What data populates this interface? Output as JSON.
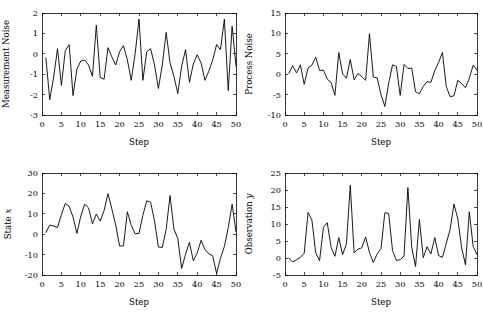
{
  "figure": {
    "background": "#ffffff",
    "line_color": "#000000",
    "width": 483,
    "height": 322,
    "panel_count": 4
  },
  "chart_data": [
    {
      "type": "line",
      "id": "measurement-noise",
      "position": "top-left",
      "title": "",
      "xlabel": "Step",
      "ylabel": "Measurement Noise",
      "ylabel_italic_suffix": "",
      "xlim": [
        0,
        50
      ],
      "ylim": [
        -3,
        2
      ],
      "xticks": [
        0,
        5,
        10,
        15,
        20,
        25,
        30,
        35,
        40,
        45,
        50
      ],
      "yticks": [
        -3,
        -2,
        -1,
        0,
        1,
        2
      ],
      "grid": false,
      "legend": "none",
      "x": [
        1,
        2,
        3,
        4,
        5,
        6,
        7,
        8,
        9,
        10,
        11,
        12,
        13,
        14,
        15,
        16,
        17,
        18,
        19,
        20,
        21,
        22,
        23,
        24,
        25,
        26,
        27,
        28,
        29,
        30,
        31,
        32,
        33,
        34,
        35,
        36,
        37,
        38,
        39,
        40,
        41,
        42,
        43,
        44,
        45,
        46,
        47,
        48,
        49,
        50
      ],
      "values": [
        -0.2,
        -2.25,
        -1.15,
        0.25,
        -1.55,
        0.15,
        0.45,
        -2.05,
        -0.75,
        -0.35,
        -0.3,
        -0.55,
        -1.1,
        1.4,
        -1.15,
        -1.25,
        0.3,
        -0.15,
        -0.55,
        0.1,
        0.4,
        -0.3,
        -1.3,
        0.0,
        1.7,
        -1.3,
        0.1,
        0.25,
        -0.55,
        -1.7,
        -0.55,
        1.05,
        -0.45,
        -1.1,
        -1.95,
        -0.6,
        0.2,
        -1.4,
        -0.5,
        -0.05,
        -0.45,
        -1.3,
        -0.85,
        -0.3,
        0.45,
        0.2,
        1.7,
        -1.8,
        1.35,
        -0.6
      ]
    },
    {
      "type": "line",
      "id": "process-noise",
      "position": "top-right",
      "title": "",
      "xlabel": "Step",
      "ylabel": "Process Noise",
      "ylabel_italic_suffix": "",
      "xlim": [
        0,
        50
      ],
      "ylim": [
        -10,
        15
      ],
      "xticks": [
        0,
        5,
        10,
        15,
        20,
        25,
        30,
        35,
        40,
        45,
        50
      ],
      "yticks": [
        -10,
        -5,
        0,
        5,
        10,
        15
      ],
      "grid": false,
      "legend": "none",
      "x": [
        1,
        2,
        3,
        4,
        5,
        6,
        7,
        8,
        9,
        10,
        11,
        12,
        13,
        14,
        15,
        16,
        17,
        18,
        19,
        20,
        21,
        22,
        23,
        24,
        25,
        26,
        27,
        28,
        29,
        30,
        31,
        32,
        33,
        34,
        35,
        36,
        37,
        38,
        39,
        40,
        41,
        42,
        43,
        44,
        45,
        46,
        47,
        48,
        49,
        50
      ],
      "values": [
        0.2,
        2.1,
        0.3,
        2.3,
        -2.5,
        1.5,
        2.2,
        4.2,
        0.9,
        1.0,
        -1.2,
        -2.0,
        -5.2,
        5.3,
        0.1,
        -1.0,
        3.6,
        -1.4,
        0.2,
        -0.6,
        -1.5,
        9.9,
        -0.7,
        -0.9,
        -5.0,
        -7.9,
        -2.2,
        2.3,
        1.9,
        -5.2,
        2.4,
        1.4,
        1.5,
        -4.3,
        -4.8,
        -3.0,
        -1.8,
        -2.0,
        0.9,
        2.9,
        5.3,
        -3.0,
        -5.5,
        -5.3,
        -1.5,
        -2.3,
        -3.3,
        -1.0,
        2.2,
        1.0
      ]
    },
    {
      "type": "line",
      "id": "state-x",
      "position": "bottom-left",
      "title": "",
      "xlabel": "Step",
      "ylabel": "State ",
      "ylabel_italic_suffix": "x",
      "xlim": [
        0,
        50
      ],
      "ylim": [
        -20,
        30
      ],
      "xticks": [
        0,
        5,
        10,
        15,
        20,
        25,
        30,
        35,
        40,
        45,
        50
      ],
      "yticks": [
        -20,
        -10,
        0,
        10,
        20,
        30
      ],
      "grid": false,
      "legend": "none",
      "x": [
        1,
        2,
        3,
        4,
        5,
        6,
        7,
        8,
        9,
        10,
        11,
        12,
        13,
        14,
        15,
        16,
        17,
        18,
        19,
        20,
        21,
        22,
        23,
        24,
        25,
        26,
        27,
        28,
        29,
        30,
        31,
        32,
        33,
        34,
        35,
        36,
        37,
        38,
        39,
        40,
        41,
        42,
        43,
        44,
        45,
        46,
        47,
        48,
        49,
        50
      ],
      "values": [
        0.8,
        4.5,
        4.0,
        3.3,
        9.6,
        15.1,
        13.6,
        8.4,
        0.4,
        8.9,
        14.7,
        12.9,
        5.1,
        9.9,
        6.4,
        11.6,
        19.9,
        12.4,
        4.5,
        -5.8,
        -5.7,
        11.0,
        4.3,
        0.2,
        0.4,
        9.3,
        16.4,
        15.6,
        6.6,
        -6.3,
        -6.5,
        2.3,
        19.0,
        2.5,
        -2.2,
        -16.8,
        -9.8,
        -4.0,
        -13.0,
        -9.2,
        -3.0,
        -7.5,
        -9.6,
        -10.6,
        -19.3,
        -11.8,
        -6.0,
        3.2,
        14.7,
        1.2
      ]
    },
    {
      "type": "line",
      "id": "observation-y",
      "position": "bottom-right",
      "title": "",
      "xlabel": "Step",
      "ylabel": "Observation ",
      "ylabel_italic_suffix": "y",
      "xlim": [
        0,
        50
      ],
      "ylim": [
        -5,
        25
      ],
      "xticks": [
        0,
        5,
        10,
        15,
        20,
        25,
        30,
        35,
        40,
        45,
        50
      ],
      "yticks": [
        -5,
        0,
        5,
        10,
        15,
        20,
        25
      ],
      "grid": false,
      "legend": "none",
      "x": [
        1,
        2,
        3,
        4,
        5,
        6,
        7,
        8,
        9,
        10,
        11,
        12,
        13,
        14,
        15,
        16,
        17,
        18,
        19,
        20,
        21,
        22,
        23,
        24,
        25,
        26,
        27,
        28,
        29,
        30,
        31,
        32,
        33,
        34,
        35,
        36,
        37,
        38,
        39,
        40,
        41,
        42,
        43,
        44,
        45,
        46,
        47,
        48,
        49,
        50
      ],
      "values": [
        0.0,
        -1.2,
        -0.5,
        0.2,
        1.4,
        13.4,
        11.2,
        1.5,
        -0.8,
        9.0,
        10.4,
        3.1,
        0.5,
        6.0,
        1.0,
        4.2,
        21.4,
        1.5,
        2.6,
        3.0,
        6.2,
        1.6,
        -1.3,
        1.2,
        2.8,
        13.3,
        13.1,
        2.2,
        -0.7,
        -0.5,
        0.6,
        20.7,
        3.1,
        -2.5,
        11.3,
        0.1,
        3.3,
        1.2,
        6.0,
        0.7,
        0.2,
        4.3,
        8.4,
        15.9,
        11.5,
        3.0,
        -2.0,
        13.6,
        3.4,
        1.0
      ]
    }
  ]
}
